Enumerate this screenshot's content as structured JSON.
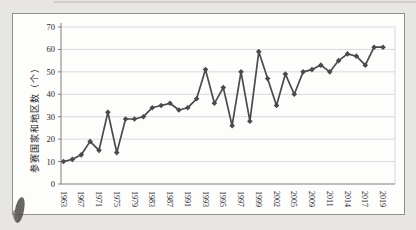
{
  "figure": {
    "background": "#fdfdfc",
    "page_background": "#e8e6e2",
    "frame_border_color": "#919191"
  },
  "chart_data": {
    "type": "line",
    "title": "",
    "xlabel": "",
    "ylabel": "参赛国家和地区数（个）",
    "ylim": [
      0,
      70
    ],
    "ytick_interval": 10,
    "yticks": [
      0,
      10,
      20,
      30,
      40,
      50,
      60,
      70
    ],
    "grid": true,
    "legend_position": "none",
    "marker": "diamond",
    "line_color": "#4a4a4a",
    "grid_color": "#d9d9d9",
    "axis_color": "#7f7f7f",
    "text_color": "#262626",
    "x_tick_labels": [
      "1963",
      "1967",
      "1971",
      "1975",
      "1979",
      "1983",
      "1987",
      "1991",
      "1993",
      "1995",
      "1997",
      "1999",
      "2002",
      "2005",
      "2009",
      "2011",
      "2014",
      "2017",
      "2019"
    ],
    "x_label_every_n_points": 2,
    "series": [
      {
        "name": "参赛国家和地区数",
        "values": [
          10,
          11,
          13,
          19,
          15,
          32,
          14,
          29,
          29,
          30,
          34,
          35,
          36,
          33,
          34,
          38,
          51,
          36,
          43,
          26,
          50,
          28,
          59,
          47,
          35,
          49,
          40,
          50,
          51,
          53,
          50,
          55,
          58,
          57,
          53,
          61,
          61
        ]
      }
    ]
  }
}
